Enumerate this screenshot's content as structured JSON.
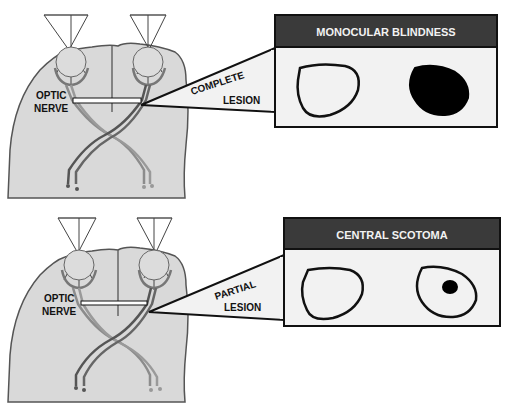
{
  "panels": [
    {
      "id": "top",
      "nerve_label_line1": "OPTIC",
      "nerve_label_line2": "NERVE",
      "lesion_label_line1": "COMPLETE",
      "lesion_label_line2": "LESION",
      "result_title": "MONOCULAR BLINDNESS",
      "left_field": "normal",
      "right_field": "fully-blind"
    },
    {
      "id": "bottom",
      "nerve_label_line1": "OPTIC",
      "nerve_label_line2": "NERVE",
      "lesion_label_line1": "PARTIAL",
      "lesion_label_line2": "LESION",
      "result_title": "CENTRAL SCOTOMA",
      "left_field": "normal",
      "right_field": "central-spot"
    }
  ],
  "colors": {
    "head_fill": "#d9d9d9",
    "outline": "#555555",
    "header_bar": "#3a3a3a",
    "callout_fill": "#f2f2f2",
    "nerve_dark": "#555555",
    "nerve_light": "#9a9a9a"
  }
}
